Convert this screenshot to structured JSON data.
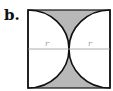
{
  "figure": {
    "label": "b.",
    "shape": "square with two semicircular arcs (radius r) from left and right sides, touching at center",
    "radius_labels": [
      "r",
      "r"
    ],
    "colors": {
      "shade": "#b8b8b8",
      "stroke": "#111111",
      "radius_line": "#999999",
      "background": "#ffffff"
    }
  }
}
